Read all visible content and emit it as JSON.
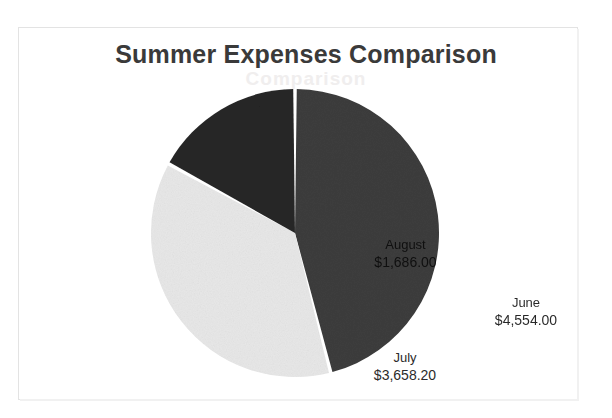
{
  "document": {
    "title": "Summer Expenses Comparison",
    "ghost_text": "Comparison"
  },
  "chart_data": {
    "type": "pie",
    "title": "Summer Expenses Comparison",
    "xlabel": "",
    "ylabel": "",
    "legend": "none",
    "labels_inside_slices": true,
    "start_angle_deg": 0,
    "direction": "clockwise",
    "categories": [
      "June",
      "July",
      "August"
    ],
    "values": [
      4554.0,
      3658.2,
      1686.0
    ],
    "value_labels": [
      "$4,554.00",
      "$3,658.20",
      "$1,686.00"
    ],
    "total": 9898.2,
    "percentages": [
      46.0,
      37.0,
      17.0
    ],
    "colors": [
      "#3d3d3d",
      "#e8e8e8",
      "#262626"
    ],
    "slices": [
      {
        "name": "June",
        "value_label": "$4,554.00",
        "value": 4554.0,
        "percent": 46.0,
        "color": "#3d3d3d"
      },
      {
        "name": "July",
        "value_label": "$3,658.20",
        "value": 3658.2,
        "percent": 37.0,
        "color": "#e8e8e8"
      },
      {
        "name": "August",
        "value_label": "$1,686.00",
        "value": 1686.0,
        "percent": 17.0,
        "color": "#262626"
      }
    ]
  }
}
